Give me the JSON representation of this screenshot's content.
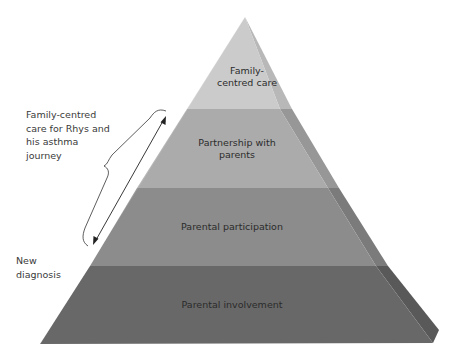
{
  "pyramid": {
    "tiers": [
      {
        "label": "Family-\ncentred care",
        "lines": [
          "Family-",
          "centred care"
        ],
        "front_color": "#c9c9c9",
        "side_color": "#b5b5b5"
      },
      {
        "label": "Partnership with parents",
        "lines": [
          "Partnership with",
          "parents"
        ],
        "front_color": "#a9a9a9",
        "side_color": "#969696"
      },
      {
        "label": "Parental participation",
        "lines": [
          "Parental participation"
        ],
        "front_color": "#8a8a8a",
        "side_color": "#777777"
      },
      {
        "label": "Parental involvement",
        "lines": [
          "Parental involvement"
        ],
        "front_color": "#666666",
        "side_color": "#575757"
      }
    ]
  },
  "annotations": {
    "journey_label_lines": [
      "Family-centred",
      "care for Rhys and",
      "his asthma",
      "journey"
    ],
    "start_label_lines": [
      "New",
      "diagnosis"
    ],
    "arrow": "double-headed",
    "bracket": "curly-brace"
  }
}
